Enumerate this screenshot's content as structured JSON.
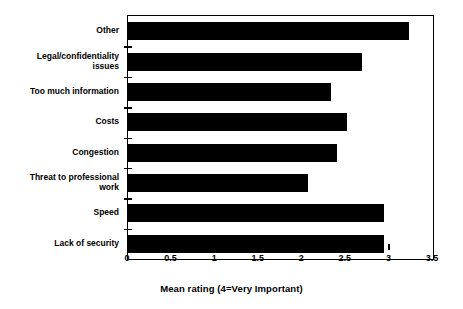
{
  "chart_data": {
    "type": "bar",
    "orientation": "horizontal",
    "title": "",
    "xlabel": "Mean rating (4=Very Important)",
    "ylabel": "",
    "xlim": [
      0,
      3.5
    ],
    "xticks": [
      "0",
      "0.5",
      "1",
      "1.5",
      "2",
      "2.5",
      "3",
      "3.5"
    ],
    "xtick_values": [
      0,
      0.5,
      1,
      1.5,
      2,
      2.5,
      3,
      3.5
    ],
    "grid": false,
    "legend": false,
    "bar_color": "#000000",
    "categories": [
      "Other",
      "Legal/confidentiality\nissues",
      "Too much information",
      "Costs",
      "Congestion",
      "Threat to professional\nwork",
      "Speed",
      "Lack of security"
    ],
    "values": [
      3.23,
      2.68,
      2.33,
      2.51,
      2.4,
      2.06,
      2.94,
      2.94
    ]
  }
}
